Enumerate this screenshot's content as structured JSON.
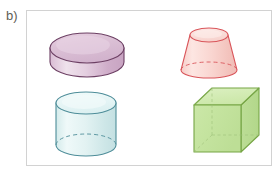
{
  "page": {
    "label": "b)",
    "background_color": "#ffffff",
    "frame_border_color": "#d2d2d2",
    "label_color": "#5f6054"
  },
  "figure": {
    "caption_letter": "b)",
    "shape_count": 4,
    "shapes": [
      {
        "id": "purple-disc-cylinder",
        "name": "Short wide cylinder (disc)",
        "position": "top-left",
        "stroke_color": "#6c3f63",
        "fill_top_color": "#ddc3d8",
        "fill_side_color": "#e8d2e3",
        "hidden_edges": "none",
        "center_x": 87,
        "center_y": 48,
        "radius_x": 37,
        "radius_y": 15,
        "height": 28
      },
      {
        "id": "pink-frustum",
        "name": "Truncated cone (frustum)",
        "position": "top-right",
        "stroke_color": "#d9555a",
        "fill_color": "#f9d6d2",
        "fill_top_color": "#fae2de",
        "hidden_edges": "dashed bottom ellipse",
        "top_center_x": 209,
        "top_center_y": 35,
        "top_radius_x": 19,
        "top_radius_y": 7,
        "bottom_center_x": 209,
        "bottom_center_y": 70,
        "bottom_radius_x": 28,
        "bottom_radius_y": 8
      },
      {
        "id": "cyan-cylinder",
        "name": "Cylinder",
        "position": "bottom-left",
        "stroke_color": "#4e8d99",
        "fill_color": "#dff0f0",
        "fill_top_color": "#ecf7f7",
        "hidden_edges": "dashed bottom ellipse",
        "center_x": 86,
        "top_center_y": 103,
        "bottom_center_y": 145,
        "radius_x": 30,
        "radius_y": 11
      },
      {
        "id": "green-cube",
        "name": "Cube",
        "position": "bottom-right",
        "stroke_color": "#76a545",
        "fill_front_color": "#c9e5a4",
        "fill_top_color": "#d6edb5",
        "fill_side_color": "#bedb95",
        "hidden_edges": "visible interior edges (transparent)",
        "front_left_x": 194,
        "front_top_y": 105,
        "front_size": 47,
        "depth_dx": 18,
        "depth_dy": -17
      }
    ]
  }
}
